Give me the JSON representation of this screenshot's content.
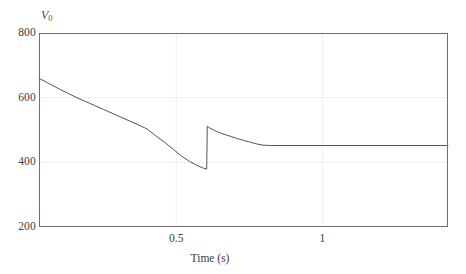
{
  "chart_data": {
    "type": "line",
    "title": "",
    "xlabel": "Time (s)",
    "ylabel": "V0",
    "ylabel_display": "V",
    "ylabel_subscript": "0",
    "xlim": [
      0.03,
      1.43
    ],
    "ylim": [
      200,
      800
    ],
    "grid": true,
    "grid_color": "#efefef",
    "legend": null,
    "x_ticks": [
      0.5,
      1
    ],
    "x_tick_labels": [
      "0.5",
      "1"
    ],
    "y_ticks": [
      200,
      400,
      600,
      800
    ],
    "y_tick_labels": [
      "200",
      "400",
      "600",
      "800"
    ],
    "line_color": "#555555",
    "line_width": 1,
    "series": [
      {
        "name": "V0",
        "x": [
          0.03,
          0.055,
          0.08,
          0.105,
          0.13,
          0.16,
          0.19,
          0.22,
          0.25,
          0.28,
          0.31,
          0.34,
          0.37,
          0.4,
          0.43,
          0.46,
          0.49,
          0.52,
          0.545,
          0.57,
          0.59,
          0.604,
          0.606,
          0.615,
          0.63,
          0.65,
          0.67,
          0.69,
          0.71,
          0.73,
          0.75,
          0.77,
          0.79,
          0.8,
          0.82,
          0.86,
          0.9,
          0.96,
          1.02,
          1.1,
          1.2,
          1.3,
          1.43
        ],
        "y": [
          660,
          648,
          636,
          624,
          613,
          600,
          588,
          576,
          564,
          552,
          540,
          528,
          516,
          503,
          482,
          462,
          440,
          418,
          403,
          391,
          383,
          379,
          512,
          506,
          499,
          491,
          485,
          479,
          473,
          468,
          463,
          458,
          454,
          453,
          452,
          452,
          452,
          452,
          452,
          452,
          452,
          452,
          452
        ]
      }
    ],
    "annotations": {
      "minimum_value": 379,
      "minimum_time": 0.604,
      "peak_after_jump": 512,
      "peak_time": 0.606,
      "start_value": 660,
      "steady_state_value": 452
    }
  },
  "axes": {
    "frame_color": "#6e6e6e",
    "background": "#ffffff"
  }
}
